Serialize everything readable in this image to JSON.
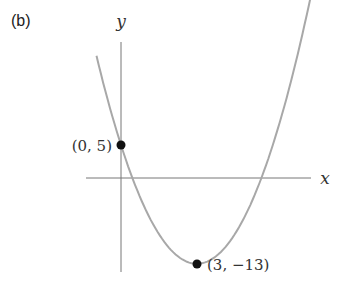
{
  "panel_label": "(b)",
  "chart_data": {
    "type": "line",
    "title": "",
    "function": "y = 2(x - 3)^2 - 13",
    "xlabel": "x",
    "ylabel": "y",
    "grid": false,
    "ticks": false,
    "xlim": [
      -1.0,
      7.6
    ],
    "ylim": [
      -14.5,
      20
    ],
    "series": [
      {
        "name": "parabola",
        "color": "#a0a0a0",
        "x": [
          -1.0,
          0,
          1,
          2,
          3,
          4,
          5,
          6,
          7.0
        ],
        "y": [
          19,
          5,
          -5,
          -11,
          -13,
          -11,
          -5,
          5,
          19
        ]
      }
    ],
    "points": [
      {
        "x": 0,
        "y": 5,
        "label": "(0, 5)"
      },
      {
        "x": 3,
        "y": -13,
        "label": "(3, −13)"
      }
    ]
  },
  "labels": {
    "x_axis": "x",
    "y_axis": "y",
    "point_a": "(0, 5)",
    "point_b": "(3, −13)"
  }
}
